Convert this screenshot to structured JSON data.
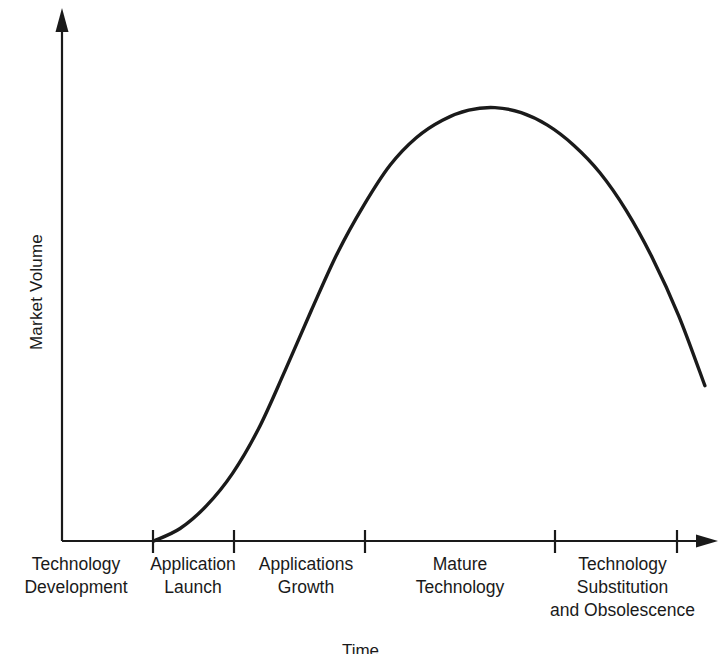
{
  "chart_data": {
    "type": "line",
    "title": "",
    "subtitle": "",
    "xlabel": "Time",
    "ylabel": "Market Volume",
    "grid": false,
    "legend": null,
    "annotations": [],
    "axis_style": {
      "x_axis_arrow": true,
      "y_axis_arrow": true,
      "ticks_labeled_with_text": true,
      "numeric_ticks": false,
      "line_color": "#1a1a1a",
      "curve_color": "#1a1a1a",
      "background": "#ffffff"
    },
    "xlim": [
      0,
      10
    ],
    "ylim": [
      0,
      10
    ],
    "categories": [
      "Technology Development",
      "Application Launch",
      "Applications Growth",
      "Mature Technology",
      "Technology Substitution and Obsolescence"
    ],
    "stage_boundaries_px": [
      62,
      153,
      234,
      365,
      555,
      677
    ],
    "series": [
      {
        "name": "Market Volume over technology life cycle",
        "x": [
          1.4,
          1.8,
          2.2,
          2.6,
          3.0,
          3.4,
          3.8,
          4.2,
          4.6,
          5.0,
          5.4,
          5.8,
          6.2,
          6.6,
          7.0,
          7.4,
          7.8,
          8.2,
          8.6,
          9.0,
          9.4,
          9.8
        ],
        "values": [
          0.0,
          0.25,
          0.7,
          1.35,
          2.25,
          3.4,
          4.6,
          5.75,
          6.7,
          7.5,
          8.05,
          8.4,
          8.6,
          8.65,
          8.55,
          8.3,
          7.9,
          7.35,
          6.6,
          5.65,
          4.5,
          3.1
        ]
      }
    ]
  },
  "axes": {
    "y_title": "Market Volume",
    "x_title": "Time"
  },
  "stage_labels": [
    {
      "line1": "Technology",
      "line2": "Development",
      "line3": ""
    },
    {
      "line1": "Application",
      "line2": "Launch",
      "line3": ""
    },
    {
      "line1": "Applications",
      "line2": "Growth",
      "line3": ""
    },
    {
      "line1": "Mature",
      "line2": "Technology",
      "line3": ""
    },
    {
      "line1": "Technology",
      "line2": "Substitution",
      "line3": "and Obsolescence"
    }
  ]
}
